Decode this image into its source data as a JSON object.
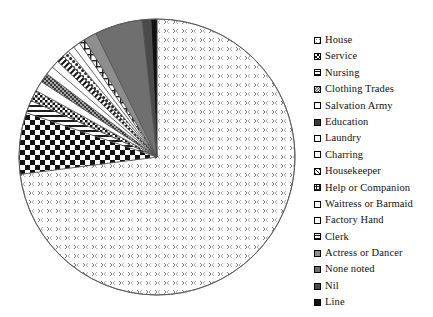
{
  "chart_data": {
    "type": "pie",
    "title": "",
    "subtitle": "",
    "xlabel": "",
    "ylabel": "",
    "legend_position": "right",
    "grid": false,
    "start_angle_deg": 0,
    "direction": "clockwise",
    "center": {
      "x": 157,
      "y": 157
    },
    "radius": 138,
    "categories": [
      "House",
      "Service",
      "Nursing",
      "Clothing Trades",
      "Salvation Army",
      "Education",
      "Laundry",
      "Charring",
      "Housekeeper",
      "Help or Companion",
      "Waitress or Barmaid",
      "Factory Hand",
      "Clerk",
      "Actress or Dancer",
      "None noted",
      "Nil",
      "Line"
    ],
    "values": [
      73.0,
      7.2,
      1.5,
      1.3,
      1.2,
      1.1,
      1.0,
      0.9,
      0.9,
      0.8,
      0.8,
      0.8,
      0.7,
      1.5,
      5.6,
      1.0,
      0.7
    ],
    "patterns": [
      "dot-sparse",
      "checker-large",
      "horizontal-lines",
      "checker-small",
      "blank-white",
      "dot-dense-dark",
      "blank-white",
      "blank-white",
      "diagonal-hatch",
      "dot-medium",
      "blank-white",
      "blank-white",
      "grid-lines",
      "gray-medium",
      "gray-dark",
      "gray-darker",
      "black-solid"
    ],
    "annotations": []
  },
  "legend": {
    "items": [
      {
        "label": "House",
        "swatch": "dot-sparse"
      },
      {
        "label": "Service",
        "swatch": "checker-large"
      },
      {
        "label": "Nursing",
        "swatch": "horizontal-lines"
      },
      {
        "label": "Clothing Trades",
        "swatch": "checker-small"
      },
      {
        "label": "Salvation Army",
        "swatch": "blank-white"
      },
      {
        "label": "Education",
        "swatch": "dot-dense-dark"
      },
      {
        "label": "Laundry",
        "swatch": "blank-white"
      },
      {
        "label": "Charring",
        "swatch": "blank-white"
      },
      {
        "label": "Housekeeper",
        "swatch": "diagonal-hatch"
      },
      {
        "label": "Help or Companion",
        "swatch": "dot-medium"
      },
      {
        "label": "Waitress or Barmaid",
        "swatch": "blank-white"
      },
      {
        "label": "Factory Hand",
        "swatch": "blank-white"
      },
      {
        "label": "Clerk",
        "swatch": "grid-lines"
      },
      {
        "label": "Actress or Dancer",
        "swatch": "gray-medium"
      },
      {
        "label": "None noted",
        "swatch": "gray-dark"
      },
      {
        "label": "Nil",
        "swatch": "gray-darker"
      },
      {
        "label": "Line",
        "swatch": "black-solid"
      }
    ]
  },
  "colors": {
    "background": "#ffffff",
    "outline": "#555555",
    "text": "#111111",
    "gray_medium": "#8e8e8e",
    "gray_dark": "#6f6f6f",
    "gray_darker": "#555555",
    "black": "#1a1a1a"
  }
}
